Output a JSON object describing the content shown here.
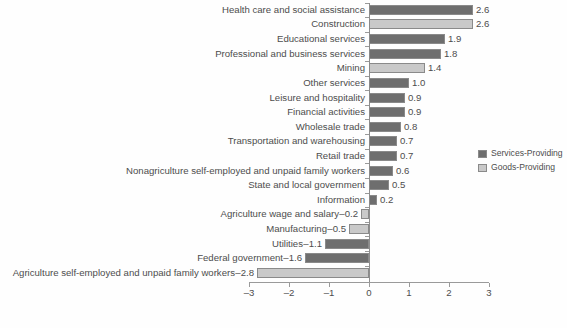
{
  "chart_data": {
    "type": "bar",
    "orientation": "horizontal",
    "title": "",
    "xlabel": "",
    "ylabel": "",
    "xlim": [
      -3,
      3
    ],
    "xticks": [
      -3,
      -2,
      -1,
      0,
      1,
      2,
      3
    ],
    "xtick_labels": [
      "–3",
      "–2",
      "–1",
      "0",
      "1",
      "2",
      "3"
    ],
    "grid": false,
    "legend_position": "right",
    "categories": [
      "Health care and social assistance",
      "Construction",
      "Educational services",
      "Professional and business services",
      "Mining",
      "Other services",
      "Leisure and hospitality",
      "Financial activities",
      "Wholesale trade",
      "Transportation and warehousing",
      "Retail trade",
      "Nonagriculture self-employed and unpaid family workers",
      "State and local government",
      "Information",
      "Agriculture wage and salary",
      "Manufacturing",
      "Utilities",
      "Federal government",
      "Agriculture self-employed and unpaid family workers"
    ],
    "values": [
      2.6,
      2.6,
      1.9,
      1.8,
      1.4,
      1.0,
      0.9,
      0.9,
      0.8,
      0.7,
      0.7,
      0.6,
      0.5,
      0.2,
      -0.2,
      -0.5,
      -1.1,
      -1.6,
      -2.8
    ],
    "value_labels": [
      "2.6",
      "2.6",
      "1.9",
      "1.8",
      "1.4",
      "1.0",
      "0.9",
      "0.9",
      "0.8",
      "0.7",
      "0.7",
      "0.6",
      "0.5",
      "0.2",
      "–0.2",
      "–0.5",
      "–1.1",
      "–1.6",
      "–2.8"
    ],
    "series_of_bar": [
      "services",
      "goods",
      "services",
      "services",
      "goods",
      "services",
      "services",
      "services",
      "services",
      "services",
      "services",
      "services",
      "services",
      "services",
      "goods",
      "goods",
      "services",
      "services",
      "goods"
    ],
    "legend": [
      {
        "key": "services",
        "label": "Services-Providing",
        "color": "#6e6e6e"
      },
      {
        "key": "goods",
        "label": "Goods-Providing",
        "color": "#c9c9c9"
      }
    ],
    "colors": {
      "services": "#6e6e6e",
      "goods": "#c9c9c9",
      "bar_border": "#8a8a8a",
      "axis": "#9a9a9a",
      "text": "#4d4d4d"
    }
  },
  "source_note": ""
}
